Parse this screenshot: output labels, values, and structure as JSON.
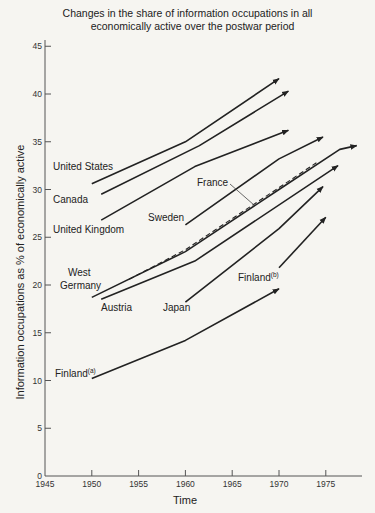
{
  "chart_data": {
    "type": "line",
    "title": "Changes in the share of information occupations in all economically active over the postwar period",
    "title_lines": [
      "Changes in the share of information occupations in all",
      "economically active over the postwar period"
    ],
    "xlabel": "Time",
    "ylabel": "Information occupations as % of economically active",
    "xlim": [
      1945,
      1980
    ],
    "ylim": [
      0,
      45
    ],
    "x_ticks": [
      1945,
      1950,
      1955,
      1960,
      1965,
      1970,
      1975
    ],
    "y_ticks": [
      0,
      5,
      10,
      15,
      20,
      25,
      30,
      35,
      40,
      45
    ],
    "grid": false,
    "legend": "direct labels",
    "series": [
      {
        "name": "United States",
        "style": "solid",
        "points": [
          [
            1950,
            30.6
          ],
          [
            1960,
            35.0
          ],
          [
            1970,
            41.6
          ]
        ],
        "label": {
          "text": "United States",
          "x": 53,
          "y": 170
        }
      },
      {
        "name": "Canada",
        "style": "solid",
        "points": [
          [
            1951,
            29.5
          ],
          [
            1961.5,
            34.6
          ],
          [
            1971,
            40.3
          ]
        ],
        "label": {
          "text": "Canada",
          "x": 53,
          "y": 203
        }
      },
      {
        "name": "United Kingdom",
        "style": "solid",
        "points": [
          [
            1951,
            26.8
          ],
          [
            1961,
            32.4
          ],
          [
            1971,
            36.2
          ]
        ],
        "label": {
          "text": "United Kingdom",
          "x": 53,
          "y": 233
        }
      },
      {
        "name": "Sweden",
        "style": "solid",
        "points": [
          [
            1960,
            26.3
          ],
          [
            1970,
            33.2
          ],
          [
            1974.7,
            35.5
          ]
        ],
        "label": {
          "text": "Sweden",
          "x": 148,
          "y": 221
        }
      },
      {
        "name": "West Germany",
        "style": "solid",
        "points": [
          [
            1950,
            18.7
          ],
          [
            1960,
            23.5
          ],
          [
            1970,
            30.0
          ],
          [
            1976.5,
            34.2
          ],
          [
            1978.3,
            34.6
          ]
        ],
        "label": {
          "text": "West Germany",
          "lines": [
            "West",
            "Germany"
          ],
          "x": 60,
          "y": 276
        }
      },
      {
        "name": "France",
        "style": "dashed",
        "points": [
          [
            1954,
            20.6
          ],
          [
            1960,
            23.7
          ],
          [
            1974,
            32.8
          ]
        ],
        "label": {
          "text": "France",
          "x": 197,
          "y": 186
        },
        "leader": [
          [
            230,
            184
          ],
          [
            254,
            205
          ]
        ]
      },
      {
        "name": "Austria",
        "style": "solid",
        "points": [
          [
            1951,
            18.5
          ],
          [
            1961,
            22.5
          ],
          [
            1976.3,
            32.5
          ]
        ],
        "label": {
          "text": "Austria",
          "x": 101,
          "y": 311
        }
      },
      {
        "name": "Japan",
        "style": "solid",
        "points": [
          [
            1960,
            18.2
          ],
          [
            1970,
            25.9
          ],
          [
            1974.7,
            30.3
          ]
        ],
        "label": {
          "text": "Japan",
          "x": 163,
          "y": 311
        }
      },
      {
        "name": "Finland(b)",
        "style": "solid",
        "points": [
          [
            1970,
            21.8
          ],
          [
            1975,
            27.1
          ]
        ],
        "label": {
          "text": "Finland",
          "sup": "(b)",
          "x": 238,
          "y": 281
        }
      },
      {
        "name": "Finland(a)",
        "style": "solid",
        "points": [
          [
            1950,
            10.2
          ],
          [
            1960,
            14.2
          ],
          [
            1970,
            19.6
          ]
        ],
        "label": {
          "text": "Finland",
          "sup": "(a)",
          "x": 55,
          "y": 377
        }
      }
    ]
  },
  "colors": {
    "background": "#f6f5f1",
    "ink": "#222222"
  }
}
